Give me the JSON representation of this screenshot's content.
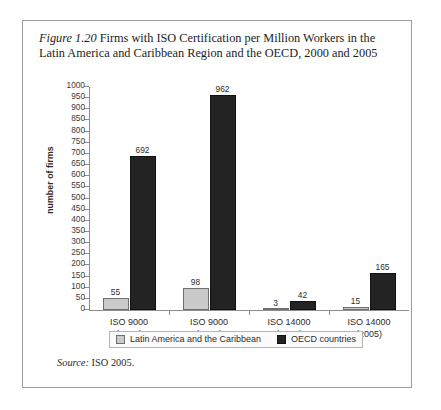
{
  "figure": {
    "label": "Figure 1.20",
    "caption": "Firms with ISO Certification per Million Workers in the Latin America and Caribbean Region and the OECD, 2000 and 2005",
    "source_label": "Source:",
    "source_text": "ISO 2005."
  },
  "chart_data": {
    "type": "bar",
    "title": "Firms with ISO Certification per Million Workers in the Latin America and Caribbean Region and the OECD, 2000 and 2005",
    "xlabel": "",
    "ylabel": "number of firms",
    "ylim": [
      0,
      1000
    ],
    "ytick_step": 50,
    "yticks": [
      0,
      50,
      100,
      150,
      200,
      250,
      300,
      350,
      400,
      450,
      500,
      550,
      600,
      650,
      700,
      750,
      800,
      850,
      900,
      950,
      1000
    ],
    "grid": false,
    "legend_position": "bottom",
    "categories": [
      "ISO 9000",
      "ISO 9000",
      "ISO 14000",
      "ISO 14000"
    ],
    "category_years": [
      "(2000)",
      "(2005)",
      "(2000)",
      "(2005)"
    ],
    "series": [
      {
        "name": "Latin America and the Caribbean",
        "color": "#c9c9c9",
        "values": [
          55,
          98,
          3,
          15
        ]
      },
      {
        "name": "OECD countries",
        "color": "#232323",
        "values": [
          692,
          962,
          42,
          165
        ]
      }
    ]
  }
}
